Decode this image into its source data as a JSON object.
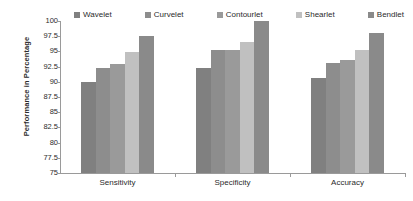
{
  "chart_data": {
    "type": "bar",
    "title": "",
    "xlabel": "",
    "ylabel": "Performance in Percentage",
    "categories": [
      "Sensitivity",
      "Specificity",
      "Accuracy"
    ],
    "ylim": [
      75,
      100
    ],
    "ytick_labels": [
      "100",
      "97.5",
      "95",
      "92.5",
      "90",
      "87.5",
      "85",
      "82.5",
      "80",
      "77.5",
      "75"
    ],
    "yticks": [
      100,
      97.5,
      95,
      92.5,
      90,
      87.5,
      85,
      82.5,
      80,
      77.5,
      75
    ],
    "grid": false,
    "legend_position": "top",
    "series": [
      {
        "name": "Wavelet",
        "color": "#808080",
        "values": [
          90.0,
          92.3,
          90.6
        ]
      },
      {
        "name": "Curvelet",
        "color": "#8d8d8d",
        "values": [
          92.3,
          95.2,
          93.1
        ]
      },
      {
        "name": "Contourlet",
        "color": "#9a9a9a",
        "values": [
          92.9,
          95.2,
          93.6
        ]
      },
      {
        "name": "Shearlet",
        "color": "#c0c0c0",
        "values": [
          94.9,
          96.5,
          95.2
        ]
      },
      {
        "name": "Bendlet",
        "color": "#8a8a8a",
        "values": [
          97.5,
          100.0,
          98.1
        ]
      }
    ]
  }
}
